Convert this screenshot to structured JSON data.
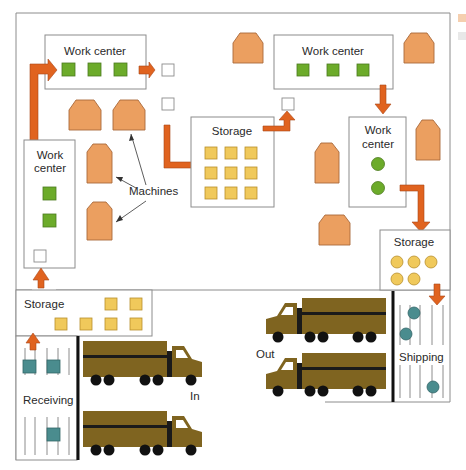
{
  "diagram": {
    "colors": {
      "work_item_green": "#6cab2a",
      "storage_yellow": "#f0c95b",
      "machine_orange": "#eb9f60",
      "flow_arrow": "#e0631f",
      "truck_brown": "#7f6420",
      "dock_teal": "#4a8c8e"
    },
    "nodes": {
      "work_center_top_left": {
        "label": "Work center",
        "items": 3,
        "item_shape": "square"
      },
      "work_center_left": {
        "label_line1": "Work",
        "label_line2": "center",
        "items": 2,
        "item_shape": "square"
      },
      "storage_middle": {
        "label": "Storage",
        "items": 9,
        "item_shape": "square"
      },
      "work_center_top_right": {
        "label": "Work center",
        "items": 3,
        "item_shape": "square"
      },
      "work_center_right": {
        "label_line1": "Work",
        "label_line2": "center",
        "items": 2,
        "item_shape": "circle"
      },
      "storage_right": {
        "label": "Storage",
        "items": 5,
        "item_shape": "circle"
      },
      "storage_bottom_left": {
        "label": "Storage",
        "items": 6,
        "item_shape": "square"
      },
      "receiving": {
        "label": "Receiving",
        "items": 3
      },
      "shipping": {
        "label": "Shipping",
        "items": 3
      }
    },
    "annotations": {
      "machines": "Machines",
      "trucks_in": "In",
      "trucks_out": "Out"
    },
    "trucks": {
      "in_count": 2,
      "out_count": 2
    }
  }
}
